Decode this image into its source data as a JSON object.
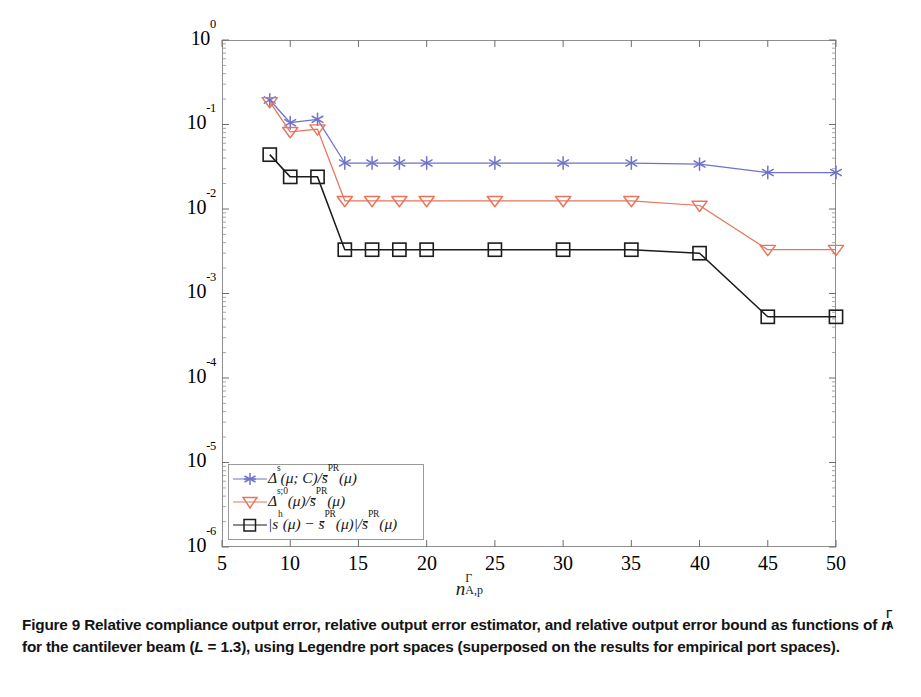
{
  "figure": {
    "label": "Figure 9",
    "caption_part1": "Relative compliance output error, relative output error estimator, and relative output error bound as functions of ",
    "caption_symbol": "n",
    "caption_symbol_sup": "Γ",
    "caption_symbol_sub": "A",
    "caption_part2": " for the cantilever beam (",
    "caption_L": "L",
    "caption_L_value": " = 1.3",
    "caption_part3": "), using Legendre port spaces (superposed on the results for empirical port spaces)."
  },
  "axes": {
    "xlabel_base": "n",
    "xlabel_sup": "Γ",
    "xlabel_sub": "A,p",
    "xticks": [
      5,
      10,
      15,
      20,
      25,
      30,
      35,
      40,
      45,
      50
    ],
    "xlim": [
      5,
      50
    ],
    "yticks": [
      "0",
      "-1",
      "-2",
      "-3",
      "-4",
      "-5",
      "-6"
    ],
    "ytick_base": "10",
    "ylim_exp": [
      -6,
      0
    ],
    "grid": false
  },
  "legend": {
    "position": "lower-left",
    "entries": [
      {
        "marker": "asterisk",
        "color": "#6f72c9",
        "delta": "Δ",
        "delta_sup": "s",
        "args": "(μ; C)/",
        "sbar": "s̄",
        "sbar_sup": "PR",
        "tail": "(μ)"
      },
      {
        "marker": "triangle-down",
        "color": "#e8745b",
        "delta": "Δ",
        "delta_sup": "s;0",
        "args": "(μ)/",
        "sbar": "s̄",
        "sbar_sup": "PR",
        "tail": "(μ)"
      },
      {
        "marker": "square",
        "color": "#1c1c1c",
        "delta": "|s",
        "delta_sup": "h",
        "args": "(μ) − ",
        "sbar": "s̄",
        "sbar_sup": "PR",
        "tail": "(μ)|/"
      }
    ],
    "entry3_extra_sbar": "s̄",
    "entry3_extra_sup": "PR",
    "entry3_extra_tail": "(μ)"
  },
  "chart_data": {
    "type": "line",
    "title": "",
    "xlabel": "n^Γ_{A,p}",
    "ylabel": "",
    "xlim": [
      5,
      50
    ],
    "ylim": [
      1e-06,
      1
    ],
    "yscale": "log",
    "xscale": "linear",
    "grid": false,
    "legend_position": "lower left",
    "series": [
      {
        "name": "Δ^s(μ;C)/s̄^PR(μ)",
        "color": "#6f72c9",
        "marker": "asterisk",
        "x": [
          8.5,
          10,
          12,
          14,
          16,
          18,
          20,
          25,
          30,
          35,
          40,
          45,
          50
        ],
        "y": [
          0.195,
          0.105,
          0.115,
          0.035,
          0.035,
          0.035,
          0.035,
          0.035,
          0.035,
          0.035,
          0.034,
          0.027,
          0.027
        ]
      },
      {
        "name": "Δ^{s;0}(μ)/s̄^PR(μ)",
        "color": "#e8745b",
        "marker": "triangle-down",
        "x": [
          8.5,
          10,
          12,
          14,
          16,
          18,
          20,
          25,
          30,
          35,
          40,
          45,
          50
        ],
        "y": [
          0.185,
          0.082,
          0.088,
          0.0125,
          0.0125,
          0.0125,
          0.0125,
          0.0125,
          0.0125,
          0.0125,
          0.011,
          0.0033,
          0.0033
        ]
      },
      {
        "name": "|s^h(μ) − s̄^PR(μ)|/s̄^PR(μ)",
        "color": "#1c1c1c",
        "marker": "square",
        "x": [
          8.5,
          10,
          12,
          14,
          16,
          18,
          20,
          25,
          30,
          35,
          40,
          45,
          50
        ],
        "y": [
          0.044,
          0.024,
          0.024,
          0.0033,
          0.0033,
          0.0033,
          0.0033,
          0.0033,
          0.0033,
          0.0033,
          0.003,
          0.00053,
          0.00053
        ]
      }
    ]
  }
}
